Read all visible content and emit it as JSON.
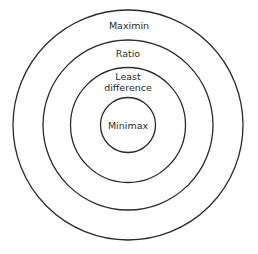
{
  "diagram": {
    "type": "concentric-circles",
    "rings": [
      {
        "id": "outer",
        "label": "Maximin"
      },
      {
        "id": "second",
        "label": "Ratio"
      },
      {
        "id": "third",
        "label_line1": "Least",
        "label_line2": "difference"
      },
      {
        "id": "inner",
        "label": "Minimax"
      }
    ],
    "stroke_color": "#2a2a2a",
    "background": "#ffffff"
  }
}
